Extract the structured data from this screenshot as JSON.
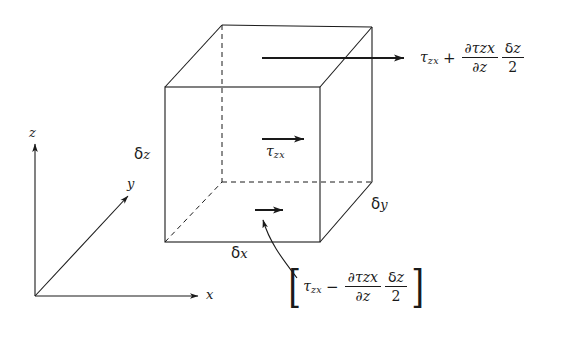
{
  "figure": {
    "background_color": "#ffffff",
    "line_color": "#1a1a1a",
    "axes": {
      "z_label": "z",
      "y_label": "y",
      "x_label": "x"
    },
    "element": {
      "height_label_symbol": "δ",
      "height_label_var": "z",
      "depth_label_symbol": "δ",
      "depth_label_var": "y",
      "width_label_symbol": "δ",
      "width_label_var": "x"
    },
    "stresses": {
      "center": {
        "symbol": "τ",
        "subscript": "zx"
      },
      "top": {
        "symbol": "τ",
        "subscript": "zx",
        "operator": "+",
        "numerator_partial": "∂",
        "numerator_symbol": "τ",
        "numerator_subscript": "zx",
        "denominator_partial": "∂",
        "denominator_var": "z",
        "factor_numerator_symbol": "δ",
        "factor_numerator_var": "z",
        "factor_denominator": "2"
      },
      "bottom": {
        "open_bracket": "[",
        "close_bracket": "]",
        "symbol": "τ",
        "subscript": "zx",
        "operator": "−",
        "numerator_partial": "∂",
        "numerator_symbol": "τ",
        "numerator_subscript": "zx",
        "denominator_partial": "∂",
        "denominator_var": "z",
        "factor_numerator_symbol": "δ",
        "factor_numerator_var": "z",
        "factor_denominator": "2"
      }
    }
  }
}
